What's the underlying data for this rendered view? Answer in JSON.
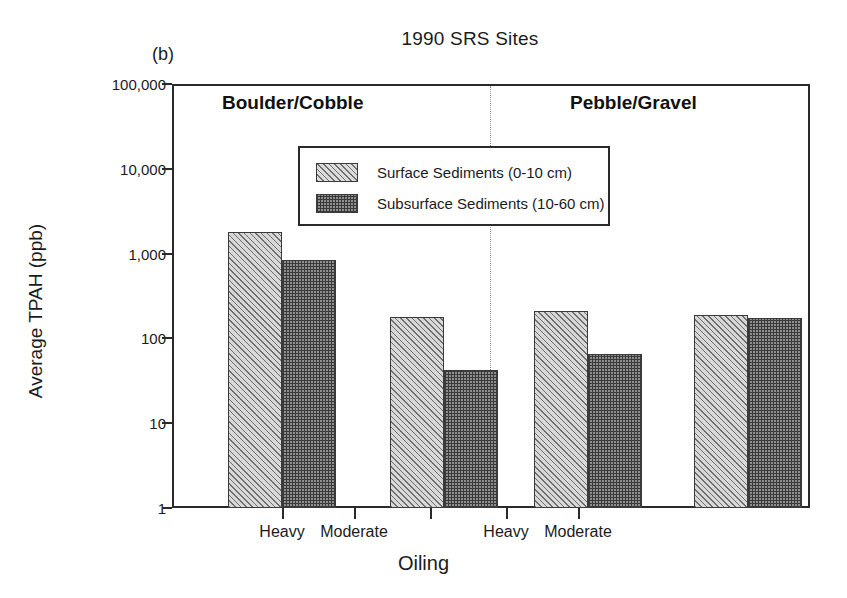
{
  "figure": {
    "panel_label": "(b)",
    "title": "1990 SRS Sites"
  },
  "axes": {
    "y_title": "Average TPAH (ppb)",
    "x_title": "Oiling",
    "y_ticks": [
      "100,000",
      "10,000",
      "1,000",
      "100",
      "10",
      "1"
    ],
    "x_ticks": [
      "Heavy",
      "Moderate",
      "Heavy",
      "Moderate"
    ]
  },
  "group_headers": [
    {
      "label": "Boulder/Cobble"
    },
    {
      "label": "Pebble/Gravel"
    }
  ],
  "legend": {
    "entries": [
      {
        "swatch": "surface",
        "label": "Surface Sediments (0-10 cm)"
      },
      {
        "swatch": "subsurface",
        "label": "Subsurface Sediments (10-60 cm)"
      }
    ]
  },
  "chart_data": {
    "type": "bar",
    "title": "1990 SRS Sites",
    "panel": "(b)",
    "xlabel": "Oiling",
    "ylabel": "Average TPAH (ppb)",
    "yscale": "log",
    "ylim": [
      1,
      100000
    ],
    "ytick_values": [
      1,
      10,
      100,
      1000,
      10000,
      100000
    ],
    "grid": false,
    "legend_position": "upper-center",
    "groups": [
      "Boulder/Cobble",
      "Boulder/Cobble",
      "Pebble/Gravel",
      "Pebble/Gravel"
    ],
    "categories": [
      "Heavy",
      "Moderate",
      "Heavy",
      "Moderate"
    ],
    "series": [
      {
        "name": "Surface Sediments (0-10 cm)",
        "values": [
          1800,
          180,
          210,
          190
        ]
      },
      {
        "name": "Subsurface Sediments (10-60 cm)",
        "values": [
          850,
          42,
          65,
          172
        ]
      }
    ]
  },
  "geometry": {
    "plot_left": 172,
    "plot_right": 810,
    "plot_top": 84,
    "plot_bottom": 508,
    "decade_px": 84.8,
    "bar_width": 54,
    "group_centers": [
      282,
      354,
      506,
      578
    ],
    "pair_left": [
      228,
      390,
      534,
      694
    ]
  }
}
